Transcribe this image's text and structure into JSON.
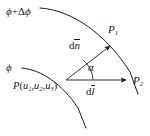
{
  "figure": {
    "width": 150,
    "height": 136,
    "background": "#ffffff",
    "stroke_color": "#1a1a1a",
    "text_color": "#1a1a1a"
  },
  "labels": {
    "outer_surface": "ϕ +Δϕ",
    "outer_surface_phi": "ϕ",
    "outer_surface_plus": "+",
    "outer_surface_delta": "Δ",
    "inner_surface": "ϕ",
    "point_p_name": "P",
    "point_p_open": "(",
    "point_p_u": "u",
    "point_p_sub1": "1",
    "point_p_sub2": "2",
    "point_p_sub3": "3",
    "point_p_comma": ",",
    "point_p_close": ")",
    "point_p_full": "P(u1,u2,u3)",
    "point_p1": "P",
    "point_p1_sub": "1",
    "point_p2": "P",
    "point_p2_sub": "2",
    "vector_dn_d": "d",
    "vector_dn_n": "n",
    "vector_dn_full": "dn̄",
    "vector_dl_d": "d",
    "vector_dl_l": "l",
    "vector_dl_full": "dl̄",
    "angle_alpha": "α"
  },
  "geometry": {
    "outer_arc_path": "M 40 8 C 72 10, 106 34, 130 72 L 138 94",
    "inner_arc_path": "M 22 68 C 42 70, 62 84, 78 108 L 86 128",
    "normal_vector_line": {
      "x1": 66,
      "y1": 80,
      "x2": 110,
      "y2": 46
    },
    "displacement_vector_line": {
      "x1": 66,
      "y1": 80,
      "x2": 126,
      "y2": 80
    },
    "angle_arc_path": "M 93 80 A 27 27 0 0 0 83 60",
    "angle_arc_radius": 27,
    "vertex": {
      "x": 66,
      "y": 80
    }
  },
  "icons": {
    "arrowhead_normal": "arrowhead-icon",
    "arrowhead_displacement": "arrowhead-icon"
  }
}
